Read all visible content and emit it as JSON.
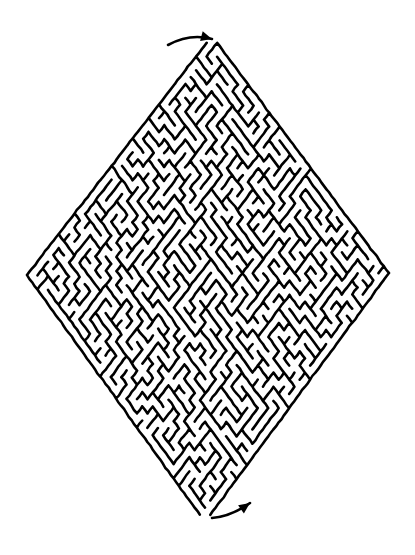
{
  "puzzle": {
    "type": "maze",
    "shape": "diamond",
    "title": "",
    "colors": {
      "background": "#ffffff",
      "wall": "#000000",
      "arrow": "#000000"
    },
    "vertices": {
      "top": [
        212,
        36
      ],
      "right": [
        389,
        273
      ],
      "bottom": [
        205,
        522
      ],
      "left": [
        27,
        275
      ]
    },
    "cell_size": 8.6,
    "wall_width": 2.6,
    "seed": 1337,
    "entry": {
      "label": "start",
      "arrow_from": [
        168,
        45
      ],
      "arrow_to": [
        212,
        39
      ],
      "direction": "right"
    },
    "exit": {
      "label": "finish",
      "arrow_from": [
        212,
        518
      ],
      "arrow_to": [
        250,
        503
      ],
      "direction": "up-right"
    }
  }
}
